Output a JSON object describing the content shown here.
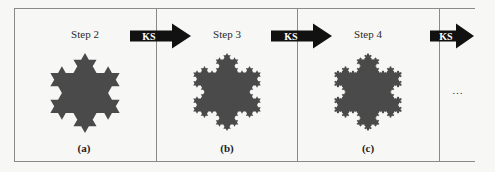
{
  "diagram": {
    "panels": [
      {
        "id": "a",
        "step_label": "Step 2",
        "caption": "(a)",
        "iterations": 2
      },
      {
        "id": "b",
        "step_label": "Step 3",
        "caption": "(b)",
        "iterations": 3
      },
      {
        "id": "c",
        "step_label": "Step 4",
        "caption": "(c)",
        "iterations": 4
      }
    ],
    "arrows": [
      {
        "label": "KS"
      },
      {
        "label": "KS"
      },
      {
        "label": "KS"
      }
    ],
    "continuation": "…",
    "colors": {
      "snowflake_fill": "#4a4a4a",
      "arrow_fill": "#111111",
      "arrow_text": "#ffffff",
      "frame": "#8a8a8a",
      "background": "#f7f7f5"
    }
  }
}
